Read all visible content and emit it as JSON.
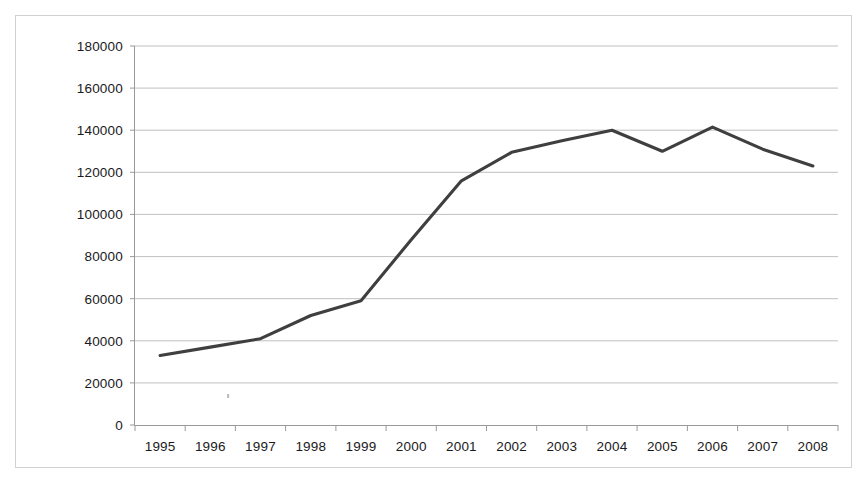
{
  "figure": {
    "background_color": "#ffffff",
    "frame_border_color": "#d2d2d2",
    "gridline_color": "#b9b9b9",
    "axis_color": "#9a9a9a",
    "series_color": "#3f3f3f"
  },
  "chart_data": {
    "type": "line",
    "title": "",
    "subtitle": "",
    "xlabel": "",
    "ylabel": "",
    "categories": [
      "1995",
      "1996",
      "1997",
      "1998",
      "1999",
      "2000",
      "2001",
      "2002",
      "2003",
      "2004",
      "2005",
      "2006",
      "2007",
      "2008"
    ],
    "values": [
      33000,
      37000,
      41000,
      52000,
      59000,
      88000,
      116000,
      129500,
      135000,
      140000,
      130000,
      141500,
      131000,
      123000
    ],
    "series": [
      {
        "name": "",
        "color": "#3f3f3f",
        "values": [
          33000,
          37000,
          41000,
          52000,
          59000,
          88000,
          116000,
          129500,
          135000,
          140000,
          130000,
          141500,
          131000,
          123000
        ]
      }
    ],
    "ylim": [
      0,
      180000
    ],
    "ytick_values": [
      0,
      20000,
      40000,
      60000,
      80000,
      100000,
      120000,
      140000,
      160000,
      180000
    ],
    "ytick_labels": [
      "0",
      "20000",
      "40000",
      "60000",
      "80000",
      "100000",
      "120000",
      "140000",
      "160000",
      "180000"
    ],
    "xtick_labels": [
      "1995",
      "1996",
      "1997",
      "1998",
      "1999",
      "2000",
      "2001",
      "2002",
      "2003",
      "2004",
      "2005",
      "2006",
      "2007",
      "2008"
    ],
    "grid": true,
    "grid_axis": "y",
    "legend": false,
    "legend_position": "none",
    "markers": false,
    "annotations": []
  }
}
